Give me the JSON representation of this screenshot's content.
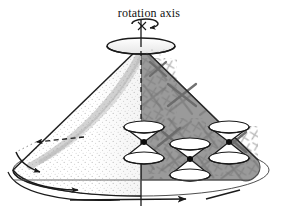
{
  "figure": {
    "title": "rotation axis",
    "caption_text": "rotation axis",
    "labels": [
      {
        "id": "rotation-axis",
        "text": "rotation axis",
        "x": 149,
        "y": 15
      }
    ],
    "colors": {
      "background": "#ffffff",
      "ink": "#1a1a1a",
      "shaded_fill": "#9a9a9a",
      "shaded_stroke": "#4a4a4a",
      "hatch_stroke": "#6b6b6b",
      "stipple": "#7a7a7a",
      "unshaded_fill": "#ffffff",
      "cone_highlight": "#f2f2f2"
    },
    "geometry": {
      "apex_center_x": 141,
      "top_ellipse": {
        "cx": 141,
        "cy": 46,
        "rx": 34,
        "ry": 8
      },
      "base_ellipse": {
        "cx": 141,
        "cy": 170,
        "rx": 128,
        "ry": 26
      },
      "rotation_arrow": {
        "cx": 141,
        "cy": 26,
        "rx": 15,
        "ry": 5
      },
      "shaded_region_corner_radius": 14
    },
    "elements": {
      "rotation_axis_line": "vertical dashed axis through cone",
      "rotation_direction_arrow": "small elliptical arrow at top of axis",
      "cone_surface": "large cone, left half unshaded with stipple, right half gray shaded with X hatching",
      "base_rim_arrows": "curved arrows along base ellipse indicating rotation",
      "radial_dashed_arrow": "dashed arrow pointing left inside cone interior",
      "horizontal_axis_arrow": "straight horizontal arrow across base",
      "tangent_tick": "short diagonal tick at lower right"
    },
    "light_cones": [
      {
        "id": "light-cone-1",
        "cx": 144,
        "cy": 140,
        "rx": 20,
        "ry": 6,
        "h": 22,
        "tilt": 0
      },
      {
        "id": "light-cone-2",
        "cx": 190,
        "cy": 157,
        "rx": 20,
        "ry": 6,
        "h": 22,
        "tilt": 0
      },
      {
        "id": "light-cone-3",
        "cx": 228,
        "cy": 140,
        "rx": 20,
        "ry": 6,
        "h": 22,
        "tilt": 0
      }
    ],
    "arrows": [
      {
        "id": "base-arrow-left",
        "kind": "curved",
        "direction": "clockwise"
      },
      {
        "id": "base-arrow-mid",
        "kind": "curved",
        "direction": "clockwise"
      },
      {
        "id": "base-arrow-front",
        "kind": "straight",
        "direction": "right"
      },
      {
        "id": "interior-dashed-arrow",
        "kind": "dashed",
        "direction": "left"
      },
      {
        "id": "axis-rotation-arrow",
        "kind": "elliptical",
        "direction": "clockwise"
      }
    ]
  }
}
